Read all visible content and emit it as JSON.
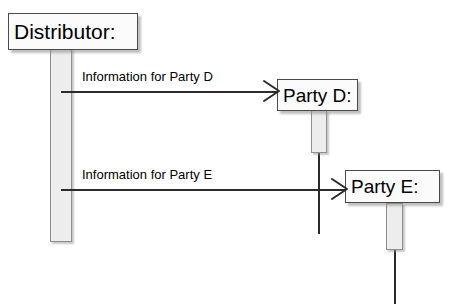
{
  "diagram": {
    "type": "uml-sequence-diagram",
    "background_color": "#ffffff",
    "line_color": "#2b2b2b",
    "box_fill_color": "#fbfbfb",
    "box_border_color": "#4a4a4a",
    "activation_fill_color": "#ededed",
    "activation_border_color": "#8e8e8e",
    "participants": [
      {
        "id": "distributor",
        "label": "Distributor:",
        "box": {
          "x": 8,
          "y": 13,
          "w": 130,
          "h": 37
        },
        "font_size": 21,
        "activation": {
          "x": 50,
          "y": 48,
          "w": 22,
          "h": 194
        },
        "lifeline": {
          "x": 60,
          "y1": 242,
          "y2": 242
        }
      },
      {
        "id": "party-d",
        "label": "Party D:",
        "box": {
          "x": 277,
          "y": 79,
          "w": 81,
          "h": 32
        },
        "font_size": 19,
        "activation": {
          "x": 311,
          "y": 110,
          "w": 16,
          "h": 43
        },
        "lifeline": {
          "x": 318,
          "y1": 152,
          "y2": 234
        }
      },
      {
        "id": "party-e",
        "label": "Party E:",
        "box": {
          "x": 345,
          "y": 170,
          "w": 95,
          "h": 33
        },
        "font_size": 19,
        "activation": {
          "x": 386,
          "y": 203,
          "w": 17,
          "h": 47
        },
        "lifeline": {
          "x": 394,
          "y1": 250,
          "y2": 304
        }
      }
    ],
    "messages": [
      {
        "id": "msg-information-for-party-d",
        "label": "Information for Party D",
        "from": "distributor",
        "to": "party-d",
        "x1": 61,
        "x2": 278,
        "y": 91,
        "label_x": 82,
        "label_y": 70,
        "font_size": 13,
        "arrow_style": "open"
      },
      {
        "id": "msg-information-for-party-e",
        "label": "Information for Party E",
        "from": "distributor",
        "to": "party-e",
        "x1": 61,
        "x2": 346,
        "y": 189,
        "label_x": 82,
        "label_y": 168,
        "font_size": 13,
        "arrow_style": "open"
      }
    ]
  }
}
